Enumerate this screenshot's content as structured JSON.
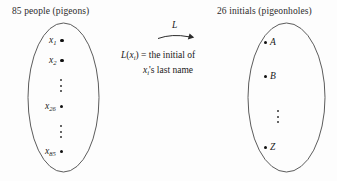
{
  "figure": {
    "type": "pigeonhole-principle-mapping-diagram",
    "background_color": "#fdfdfd",
    "ink_color": "#1a1a1a"
  },
  "left_set": {
    "caption": "85 people (pigeons)",
    "count": 85,
    "elements": [
      {
        "label": "x",
        "subscript": "1"
      },
      {
        "label": "x",
        "subscript": "2"
      },
      {
        "label": "x",
        "subscript": "26"
      },
      {
        "label": "x",
        "subscript": "85"
      }
    ],
    "ellipsis_marks": 2
  },
  "right_set": {
    "caption": "26 initials (pigeonholes)",
    "count": 26,
    "elements": [
      {
        "label": "A"
      },
      {
        "label": "B"
      },
      {
        "label": "Z"
      }
    ],
    "ellipsis_marks": 1
  },
  "mapping": {
    "arrow_label": "L",
    "definition_prefix": "L",
    "definition_arg_label": "x",
    "definition_arg_subscript": "i",
    "definition_line1_tail": " = the initial of",
    "definition_line2_label": "x",
    "definition_line2_subscript": "i",
    "definition_line2_tail": "'s last name"
  }
}
